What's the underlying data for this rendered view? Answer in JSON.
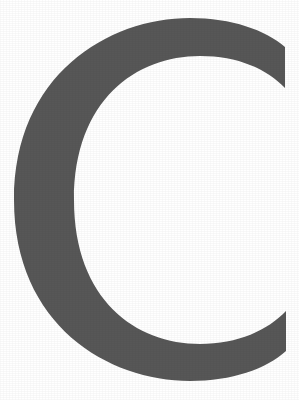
{
  "image": {
    "kind": "letterform-specimen",
    "character": "C",
    "character_name": "latin-capital-letter-c",
    "case": "uppercase",
    "description": "Large gray uppercase letter C on a plain white background",
    "width_px": 299,
    "height_px": 400
  },
  "colors": {
    "background": "#ffffff",
    "glyph_fill": "#575757",
    "glyph_fill_light": "#5e5e5e",
    "glyph_fill_dark": "#4e4e4e"
  },
  "geometry": {
    "outer_left_px": 14,
    "outer_right_px": 288,
    "outer_top_px": 18,
    "outer_bottom_px": 381,
    "counter_left_px": 70,
    "counter_top_px": 72,
    "counter_bottom_px": 328,
    "stroke_thickness_px": 55,
    "aperture_top_px": 95,
    "aperture_bottom_px": 305,
    "terminal_top_right": [
      285,
      88
    ],
    "terminal_bottom_right": [
      288,
      308
    ]
  },
  "glyph_path": "M 285 47 C 265 30 232 18 190 18 C 108 18 14 75 14 200 C 14 325 108 381 190 381 C 232 381 266 369 286 351 L 286 311 C 268 330 238 344 200 344 C 136 344 74 300 74 200 C 74 100 136 56 200 56 C 238 56 267 69 285 88 Z",
  "labels": {
    "figure_caption": "C",
    "alt_text": "Uppercase letter C rendered in dark gray on white"
  }
}
